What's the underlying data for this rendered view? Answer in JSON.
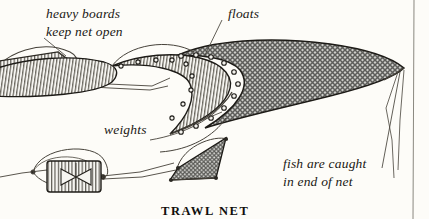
{
  "figure": {
    "title": "TRAWL NET",
    "background_color": "#fdfcf8",
    "ink_color": "#23201b",
    "labels": {
      "boards_line1": "heavy boards",
      "boards_line2": "keep net open",
      "floats": "floats",
      "weights": "weights",
      "fish_line1": "fish are caught",
      "fish_line2": "in end of net"
    },
    "parts": {
      "upper_board": "heavy-board-upper",
      "lower_board": "heavy-board-lower",
      "net_body": "trawl-net-body",
      "net_mouth": "net-mouth",
      "net_tail": "net-cod-end",
      "tow_lines": "tow-warp-lines",
      "page_rule": "page-margin-rule"
    }
  }
}
